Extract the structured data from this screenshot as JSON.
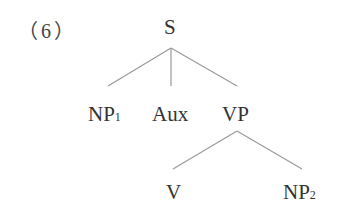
{
  "example_number": "（6）",
  "tree": {
    "root": {
      "label": "S"
    },
    "level1": [
      {
        "label": "NP",
        "subscript": "1"
      },
      {
        "label": "Aux",
        "subscript": ""
      },
      {
        "label": "VP",
        "subscript": ""
      }
    ],
    "level2": [
      {
        "label": "V",
        "subscript": ""
      },
      {
        "label": "NP",
        "subscript": "2"
      }
    ]
  },
  "colors": {
    "text": "#333333",
    "edges": "#9a9a9a",
    "background": "#ffffff"
  }
}
